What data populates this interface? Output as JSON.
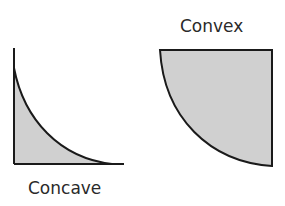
{
  "diagram": {
    "shapes": [
      {
        "id": "concave",
        "label": "Concave",
        "fill": "#d0d0d0",
        "stroke": "#1a1a1a"
      },
      {
        "id": "convex",
        "label": "Convex",
        "fill": "#d0d0d0",
        "stroke": "#1a1a1a"
      }
    ]
  }
}
